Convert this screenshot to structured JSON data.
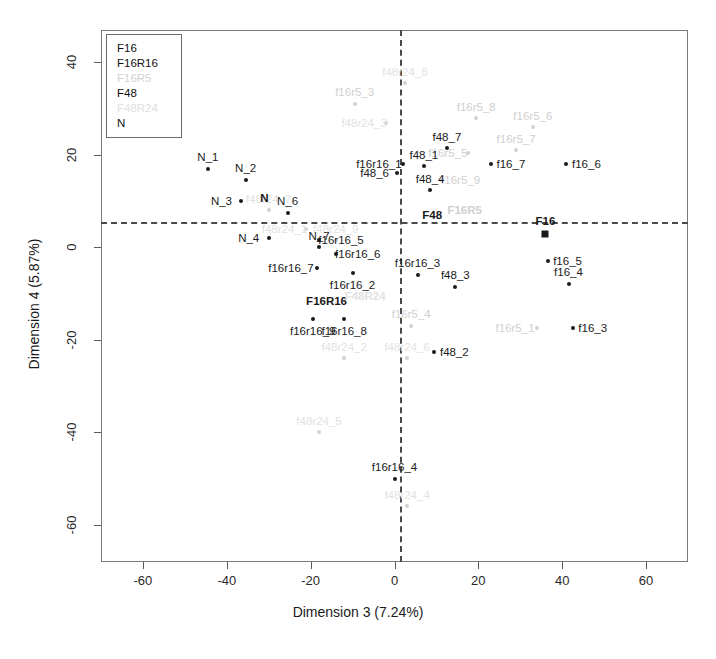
{
  "chart_data": {
    "type": "scatter",
    "title": "",
    "xlabel": "Dimension 3 (7.24%)",
    "ylabel": "Dimension 4 (5.87%)",
    "xlim": [
      -70,
      70
    ],
    "ylim": [
      -68,
      47
    ],
    "xticks": [
      -60,
      -40,
      -20,
      0,
      20,
      40,
      60
    ],
    "yticks": [
      -60,
      -40,
      -20,
      0,
      20,
      40
    ],
    "grid": false,
    "zero_lines": {
      "x": 0,
      "y": 0,
      "style": "dashed"
    },
    "legend": {
      "position": "top-left-inside",
      "entries": [
        {
          "label": "F16",
          "style": "solid"
        },
        {
          "label": "F16R16",
          "style": "solid"
        },
        {
          "label": "F16R5",
          "style": "faded"
        },
        {
          "label": "F48",
          "style": "solid"
        },
        {
          "label": "F48R24",
          "style": "faint"
        },
        {
          "label": "N",
          "style": "solid"
        }
      ]
    },
    "series": [
      {
        "name": "F16",
        "style": "solid",
        "centroid": {
          "label": "F16",
          "x": 36.0,
          "y": 3.0,
          "marker": "square",
          "label_dx": 0,
          "label_dy": -13
        },
        "points": [
          {
            "label": "f16_3",
            "x": 42.5,
            "y": -17.5,
            "label_dx": 20,
            "label_dy": 0
          },
          {
            "label": "f16_4",
            "x": 41.5,
            "y": -8.0,
            "label_dx": 0,
            "label_dy": -12
          },
          {
            "label": "f16_5",
            "x": 36.5,
            "y": -3.0,
            "label_dx": 20,
            "label_dy": 0
          },
          {
            "label": "f16_6",
            "x": 41.0,
            "y": 18.0,
            "label_dx": 20,
            "label_dy": 0
          },
          {
            "label": "f16_7",
            "x": 23.0,
            "y": 18.0,
            "label_dx": 20,
            "label_dy": 0
          }
        ]
      },
      {
        "name": "F16R16",
        "style": "solid",
        "centroid": {
          "label": "F16R16",
          "x": -10.0,
          "y": -11.5,
          "marker": "cross",
          "label_dx": -26,
          "label_dy": 0
        },
        "points": [
          {
            "label": "f16r16_1",
            "x": 2.0,
            "y": 18.0,
            "label_dx": -24,
            "label_dy": 0
          },
          {
            "label": "f16r16_2",
            "x": -10.0,
            "y": -5.5,
            "label_dx": 0,
            "label_dy": 12
          },
          {
            "label": "f16r16_3",
            "x": 5.5,
            "y": -6.0,
            "label_dx": 0,
            "label_dy": -12
          },
          {
            "label": "f16r16_4",
            "x": 0.0,
            "y": -50.0,
            "label_dx": 0,
            "label_dy": -12
          },
          {
            "label": "f16r16_5",
            "x": -18.0,
            "y": 1.5,
            "label_dx": 22,
            "label_dy": 0
          },
          {
            "label": "f16r16_6",
            "x": -14.0,
            "y": -1.5,
            "label_dx": 22,
            "label_dy": 0
          },
          {
            "label": "f16r16_7",
            "x": -18.5,
            "y": -4.5,
            "label_dx": -26,
            "label_dy": 0
          },
          {
            "label": "f16r16_8",
            "x": -12.0,
            "y": -15.5,
            "label_dx": 0,
            "label_dy": 12
          },
          {
            "label": "f16r16_9",
            "x": -19.5,
            "y": -15.5,
            "label_dx": 0,
            "label_dy": 12
          }
        ]
      },
      {
        "name": "F16R5",
        "style": "faded",
        "centroid": {
          "label": "F16R5",
          "x": 11.5,
          "y": 8.0,
          "marker": "cross",
          "label_dx": 22,
          "label_dy": 0
        },
        "points": [
          {
            "label": "f16r5_1",
            "x": 34.0,
            "y": -17.5,
            "label_dx": -22,
            "label_dy": 0
          },
          {
            "label": "f16r5_3",
            "x": -9.5,
            "y": 31.0,
            "label_dx": 0,
            "label_dy": -12
          },
          {
            "label": "f16r5_4",
            "x": 4.0,
            "y": -17.0,
            "label_dx": 0,
            "label_dy": -12
          },
          {
            "label": "f16r5_5",
            "x": 17.5,
            "y": 20.5,
            "label_dx": -20,
            "label_dy": 0
          },
          {
            "label": "f16r5_6",
            "x": 33.0,
            "y": 26.0,
            "label_dx": 0,
            "label_dy": -11
          },
          {
            "label": "f16r5_7",
            "x": 29.0,
            "y": 21.0,
            "label_dx": 0,
            "label_dy": -11
          },
          {
            "label": "f16r5_8",
            "x": 19.5,
            "y": 28.0,
            "label_dx": 0,
            "label_dy": -11
          },
          {
            "label": "f16r5_9",
            "x": 11.0,
            "y": 14.5,
            "label_dx": 20,
            "label_dy": 0
          }
        ]
      },
      {
        "name": "F48",
        "style": "solid",
        "centroid": {
          "label": "F48",
          "x": 9.0,
          "y": 4.5,
          "marker": "cross",
          "label_dx": 0,
          "label_dy": -12
        },
        "points": [
          {
            "label": "f48_1",
            "x": 7.0,
            "y": 17.5,
            "label_dx": 0,
            "label_dy": -11
          },
          {
            "label": "f48_2",
            "x": 9.5,
            "y": -22.5,
            "label_dx": 20,
            "label_dy": 0
          },
          {
            "label": "f48_3",
            "x": 14.5,
            "y": -8.5,
            "label_dx": 0,
            "label_dy": -12
          },
          {
            "label": "f48_4",
            "x": 8.5,
            "y": 12.5,
            "label_dx": 0,
            "label_dy": -11
          },
          {
            "label": "f48_6",
            "x": 0.5,
            "y": 16.0,
            "label_dx": -22,
            "label_dy": 0
          },
          {
            "label": "f48_7",
            "x": 12.5,
            "y": 21.5,
            "label_dx": 0,
            "label_dy": -11
          }
        ]
      },
      {
        "name": "F48R24",
        "style": "faint",
        "centroid": {
          "label": "F48R24",
          "x": -7.0,
          "y": -8.0,
          "marker": "cross",
          "label_dx": 0,
          "label_dy": 12
        },
        "points": [
          {
            "label": "f48r24_1",
            "x": -21.0,
            "y": 4.0,
            "label_dx": -22,
            "label_dy": 0
          },
          {
            "label": "f48r24_2",
            "x": -12.0,
            "y": -24.0,
            "label_dx": 0,
            "label_dy": -11
          },
          {
            "label": "f48r24_3",
            "x": -2.0,
            "y": 27.0,
            "label_dx": -22,
            "label_dy": 0
          },
          {
            "label": "f48r24_4",
            "x": 3.0,
            "y": -56.0,
            "label_dx": 0,
            "label_dy": -11
          },
          {
            "label": "f48r24_5",
            "x": -18.0,
            "y": -40.0,
            "label_dx": 0,
            "label_dy": -11
          },
          {
            "label": "f48r24_6",
            "x": 3.0,
            "y": -24.0,
            "label_dx": 0,
            "label_dy": -11
          },
          {
            "label": "f48r24_7",
            "x": -30.0,
            "y": 8.0,
            "label_dx": 0,
            "label_dy": -11
          },
          {
            "label": "f48r24_8",
            "x": 2.5,
            "y": 35.5,
            "label_dx": 0,
            "label_dy": -11
          },
          {
            "label": "f48r24_9",
            "x": -14.0,
            "y": 1.5,
            "label_dx": 0,
            "label_dy": -11
          }
        ]
      },
      {
        "name": "N",
        "style": "solid",
        "centroid": {
          "label": "N",
          "x": -31.0,
          "y": 8.0,
          "marker": "cross",
          "label_dx": 0,
          "label_dy": -12
        },
        "points": [
          {
            "label": "N_1",
            "x": -44.5,
            "y": 17.0,
            "label_dx": 0,
            "label_dy": -12
          },
          {
            "label": "N_2",
            "x": -35.5,
            "y": 14.5,
            "label_dx": 0,
            "label_dy": -12
          },
          {
            "label": "N_3",
            "x": -36.5,
            "y": 10.0,
            "label_dx": -20,
            "label_dy": 0
          },
          {
            "label": "N_4",
            "x": -30.0,
            "y": 2.0,
            "label_dx": -20,
            "label_dy": 0
          },
          {
            "label": "N_6",
            "x": -25.5,
            "y": 7.5,
            "label_dx": 0,
            "label_dy": -12
          },
          {
            "label": "N_7",
            "x": -18.0,
            "y": 0.0,
            "label_dx": 0,
            "label_dy": -11
          }
        ]
      }
    ]
  }
}
